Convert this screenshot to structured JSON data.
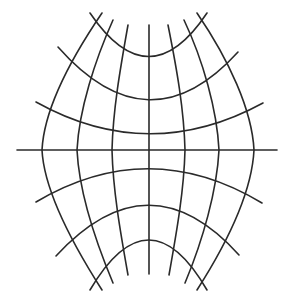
{
  "diagram": {
    "type": "map-projection-graticule",
    "colors": {
      "background": "#ffffff",
      "line": "#2a2a2a"
    },
    "meridian_count": 7,
    "parallel_count": 7,
    "equator": {
      "x1": 17,
      "y": 150,
      "x2": 277
    },
    "meridians": [
      {
        "name": "meridian-far-left",
        "d": "M102,13 C70,60 44,110 42,150 C44,190 70,240 102,290"
      },
      {
        "name": "meridian-left-2",
        "d": "M113,20 C95,60 79,110 77,150 C79,190 95,240 113,283"
      },
      {
        "name": "meridian-left-1",
        "d": "M128,25 C120,70 113,110 112,150 C113,190 120,230 128,275"
      },
      {
        "name": "meridian-center",
        "d": "M149,25 L149,274"
      },
      {
        "name": "meridian-right-1",
        "d": "M168,25 C177,70 184,110 185,150 C184,190 177,230 169,275"
      },
      {
        "name": "meridian-right-2",
        "d": "M184,20 C203,60 217,110 219,150 C217,190 203,240 185,283"
      },
      {
        "name": "meridian-far-right",
        "d": "M197,13 C229,60 252,110 254,150 C252,190 229,240 197,290"
      }
    ],
    "parallels": [
      {
        "name": "parallel-north-3",
        "d": "M90,13 Q149,100 207,13"
      },
      {
        "name": "parallel-north-2",
        "d": "M58,47 Q149,150 238,52"
      },
      {
        "name": "parallel-north-1",
        "d": "M36,102 Q149,165 263,103"
      },
      {
        "name": "parallel-south-1",
        "d": "M36,202 Q149,135 262,203"
      },
      {
        "name": "parallel-south-2",
        "d": "M56,256 Q149,155 239,255"
      },
      {
        "name": "parallel-south-3",
        "d": "M90,290 Q149,190 207,290"
      }
    ]
  }
}
